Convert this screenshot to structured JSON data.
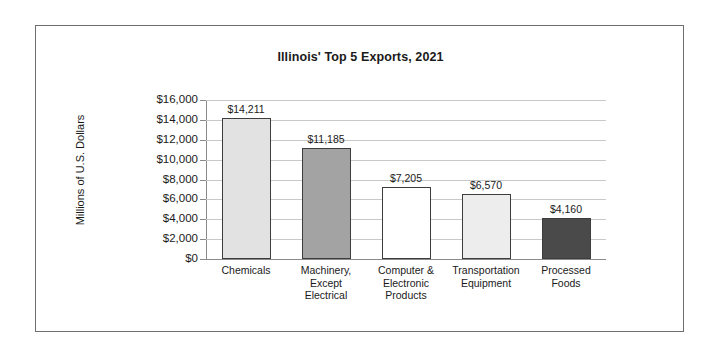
{
  "figure": {
    "title": "Illinois' Top 5 Exports, 2021",
    "y_axis_title": "Millions of U.S. Dollars",
    "frame_color": "#6e6e6e",
    "gridline_color": "#c8c8c8",
    "axis_color": "#8a8a8a",
    "bar_border_color": "#3d3d3d"
  },
  "chart_data": {
    "type": "bar",
    "title": "Illinois' Top 5 Exports, 2021",
    "xlabel": "",
    "ylabel": "Millions of U.S. Dollars",
    "ylim": [
      0,
      16000
    ],
    "ytick_labels": [
      "$16,000",
      "$14,000",
      "$12,000",
      "$10,000",
      "$8,000",
      "$6,000",
      "$4,000",
      "$2,000",
      "$0"
    ],
    "ytick_values": [
      16000,
      14000,
      12000,
      10000,
      8000,
      6000,
      4000,
      2000,
      0
    ],
    "grid": true,
    "legend": "none",
    "categories": [
      "Chemicals",
      "Machinery, Except Electrical",
      "Computer & Electronic Products",
      "Transportation Equipment",
      "Processed Foods"
    ],
    "category_lines": [
      [
        "Chemicals"
      ],
      [
        "Machinery,",
        "Except",
        "Electrical"
      ],
      [
        "Computer &",
        "Electronic",
        "Products"
      ],
      [
        "Transportation",
        "Equipment"
      ],
      [
        "Processed",
        "Foods"
      ]
    ],
    "values": [
      14211,
      11185,
      7205,
      6570,
      4160
    ],
    "value_labels": [
      "$14,211",
      "$11,185",
      "$7,205",
      "$6,570",
      "$4,160"
    ],
    "bar_colors": [
      "#e2e2e2",
      "#a3a3a3",
      "#ffffff",
      "#ededed",
      "#4a4a4a"
    ]
  }
}
